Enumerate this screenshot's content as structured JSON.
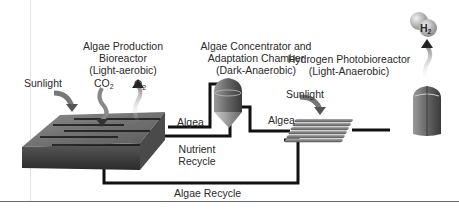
{
  "diagram": {
    "labels": {
      "production_line1": "Algae Production",
      "production_line2": "Bioreactor",
      "production_line3": "(Light-aerobic)",
      "concentrator_line1": "Algae Concentrator and",
      "concentrator_line2": "Adaptation Chamber",
      "concentrator_line3": "(Dark-Anaerobic)",
      "photobioreactor_line1": "Hydrogen Photobioreactor",
      "photobioreactor_line2": "(Light-Anaerobic)",
      "sunlight_left": "Sunlight",
      "sunlight_right": "Sunlight",
      "co2": "CO",
      "co2_sub": "2",
      "o2": "O",
      "o2_sub": "2",
      "h2": "H",
      "h2_sub": "2",
      "algea_left": "Algea",
      "algea_right": "Algea",
      "nutrient_line1": "Nutrient",
      "nutrient_line2": "Recycle",
      "algae_recycle": "Algae Recycle"
    },
    "nodes": [
      {
        "id": "production-bioreactor",
        "shape": "flat-tray"
      },
      {
        "id": "concentrator-chamber",
        "shape": "cone-bottom-tank"
      },
      {
        "id": "tubular-collector",
        "shape": "tube-array"
      },
      {
        "id": "hydrogen-photobioreactor",
        "shape": "cylinder-tank"
      },
      {
        "id": "h2-bubble",
        "shape": "molecule"
      }
    ],
    "edges": [
      {
        "from": "production-bioreactor",
        "to": "concentrator-chamber",
        "label": "Algea"
      },
      {
        "from": "concentrator-chamber",
        "to": "production-bioreactor",
        "label": "Nutrient Recycle"
      },
      {
        "from": "concentrator-chamber",
        "to": "tubular-collector",
        "label": "Algea"
      },
      {
        "from": "tubular-collector",
        "to": "hydrogen-photobioreactor",
        "label": ""
      },
      {
        "from": "tubular-collector",
        "to": "production-bioreactor",
        "label": "Algae Recycle"
      }
    ],
    "colors": {
      "pipe": "#111111",
      "tray_top": "#6e6e6e",
      "tray_side": "#3c3c3c",
      "tank": "#707070",
      "arrow": "#6a6a6a",
      "bubble": "#c8c8c8"
    }
  }
}
